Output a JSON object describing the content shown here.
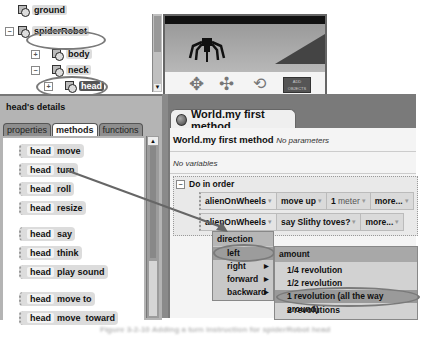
{
  "object_tree": {
    "items": [
      {
        "label": "ground",
        "indent": 1,
        "expander": "",
        "selected": false
      },
      {
        "label": "spiderRobot",
        "indent": 0,
        "expander": "−",
        "selected": false
      },
      {
        "label": "body",
        "indent": 2,
        "expander": "+",
        "selected": false
      },
      {
        "label": "neck",
        "indent": 2,
        "expander": "−",
        "selected": false
      },
      {
        "label": "head",
        "indent": 3,
        "expander": "+",
        "selected": true
      }
    ]
  },
  "scene": {
    "add_objects_label": "ADD OBJECTS",
    "controls": [
      "move-control-icon",
      "tilt-control-icon",
      "rotate-control-icon"
    ]
  },
  "details": {
    "title": "head's details",
    "tabs": [
      {
        "label": "properties",
        "active": false
      },
      {
        "label": "methods",
        "active": true
      },
      {
        "label": "functions",
        "active": false
      }
    ],
    "methods": [
      {
        "object": "head",
        "method": "move"
      },
      {
        "object": "head",
        "method": "turn"
      },
      {
        "object": "head",
        "method": "roll"
      },
      {
        "object": "head",
        "method": "resize"
      },
      {
        "object": "head",
        "method": "say"
      },
      {
        "object": "head",
        "method": "think"
      },
      {
        "object": "head",
        "method": "play sound"
      },
      {
        "object": "head",
        "method": "move to"
      },
      {
        "object": "head",
        "method": "move  toward"
      }
    ]
  },
  "editor": {
    "tab_label": "World.my first method",
    "method_name": "World.my first method",
    "parameters": "No parameters",
    "variables": "No variables",
    "block_label": "Do in order",
    "block_expander": "−",
    "statements": [
      {
        "object": "alienOnWheels",
        "method": "move",
        "arg1": "up",
        "arg2": "1",
        "arg2_unit": "meter",
        "more": "more..."
      },
      {
        "object": "alienOnWheels",
        "method": "say",
        "arg1": "Slithy toves?",
        "more": "more..."
      }
    ]
  },
  "direction_menu": {
    "header": "direction",
    "items": [
      {
        "label": "left",
        "highlighted": true,
        "submenu": false
      },
      {
        "label": "right",
        "highlighted": false,
        "submenu": true
      },
      {
        "label": "forward",
        "highlighted": false,
        "submenu": true
      },
      {
        "label": "backward",
        "highlighted": false,
        "submenu": true
      }
    ]
  },
  "amount_menu": {
    "header": "amount",
    "items": [
      {
        "label": "1/4 revolution",
        "highlighted": false
      },
      {
        "label": "1/2 revolution",
        "highlighted": false
      },
      {
        "label": "1 revolution (all the way around)",
        "highlighted": true
      },
      {
        "label": "2 revolutions",
        "highlighted": false
      }
    ]
  },
  "caption": "Figure 3-2-10  Adding a turn instruction for spiderRobot head"
}
